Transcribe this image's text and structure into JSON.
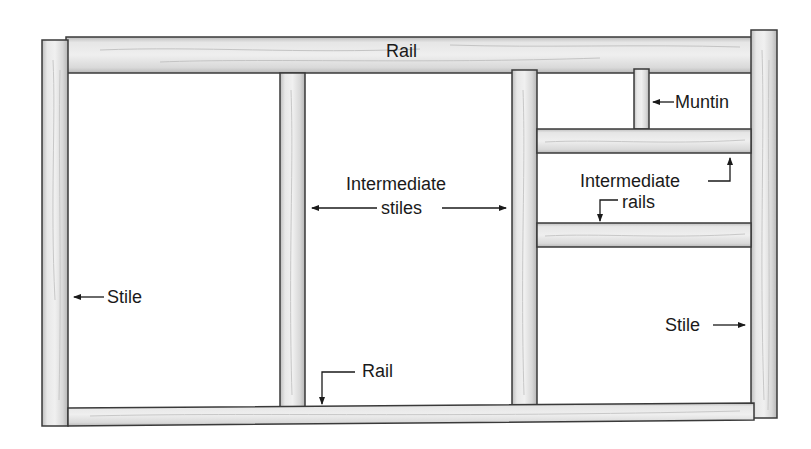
{
  "diagram": {
    "colors": {
      "wood_light": "#ececec",
      "wood_mid": "#d6d6d6",
      "wood_dark": "#bdbdbd",
      "outline": "#3a3a3a",
      "text": "#1a1a1a",
      "background": "#ffffff"
    },
    "parts": [
      {
        "name": "top-rail",
        "type": "rail"
      },
      {
        "name": "bottom-rail",
        "type": "rail"
      },
      {
        "name": "left-stile",
        "type": "stile"
      },
      {
        "name": "right-stile",
        "type": "stile"
      },
      {
        "name": "intermediate-stile-1",
        "type": "intermediate stile"
      },
      {
        "name": "intermediate-stile-2",
        "type": "intermediate stile"
      },
      {
        "name": "intermediate-rail-1",
        "type": "intermediate rail"
      },
      {
        "name": "intermediate-rail-2",
        "type": "intermediate rail"
      },
      {
        "name": "muntin",
        "type": "muntin"
      }
    ],
    "labels": {
      "top_rail": "Rail",
      "muntin": "Muntin",
      "intermediate_stiles_line1": "Intermediate",
      "intermediate_stiles_line2": "stiles",
      "intermediate_rails_line1": "Intermediate",
      "intermediate_rails_line2": "rails",
      "left_stile": "Stile",
      "right_stile": "Stile",
      "bottom_rail": "Rail"
    }
  }
}
